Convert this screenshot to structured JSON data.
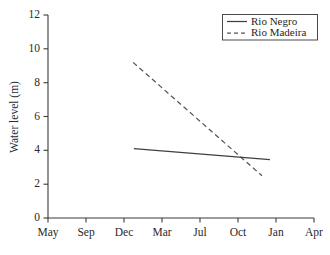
{
  "chart_data": {
    "type": "line",
    "title": "",
    "xlabel": "",
    "ylabel": "Water level (m)",
    "ylim": [
      0,
      12
    ],
    "yticks": [
      0,
      2,
      4,
      6,
      8,
      10,
      12
    ],
    "ytick_labels": [
      "0",
      "2",
      "4",
      "6",
      "8",
      "10",
      "12"
    ],
    "x_categories": [
      "May",
      "Sep",
      "Dec",
      "Mar",
      "Jul",
      "Oct",
      "Jan",
      "Apr"
    ],
    "grid": false,
    "legend_position": "top-right",
    "series": [
      {
        "name": "Rio Negro",
        "style": "solid",
        "color": "#3f3f3f",
        "points": [
          {
            "x_label": "Dec",
            "x_index": 2.26,
            "y": 4.1
          },
          {
            "x_label": "Jan",
            "x_index": 5.84,
            "y": 3.45
          }
        ]
      },
      {
        "name": "Rio Madeira",
        "style": "dashed",
        "color": "#555555",
        "points": [
          {
            "x_label": "Dec",
            "x_index": 2.24,
            "y": 9.2
          },
          {
            "x_label": "Oct",
            "x_index": 5.63,
            "y": 2.5
          }
        ]
      }
    ]
  },
  "legend": {
    "entries": [
      {
        "label": "Rio Negro",
        "style": "solid"
      },
      {
        "label": "Rio Madeira",
        "style": "dashed"
      }
    ]
  },
  "axes": {
    "y_title": "Water level (m)",
    "y_labels": [
      "12",
      "10",
      "8",
      "6",
      "4",
      "2",
      "0"
    ],
    "x_labels": [
      "May",
      "Sep",
      "Dec",
      "Mar",
      "Jul",
      "Oct",
      "Jan",
      "Apr"
    ]
  }
}
